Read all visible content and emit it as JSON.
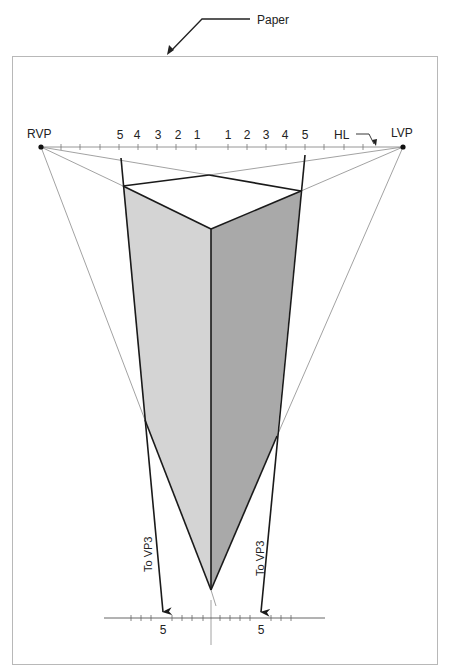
{
  "callout": {
    "label": "Paper"
  },
  "horizon": {
    "label": "HL",
    "left_vp_label": "RVP",
    "right_vp_label": "LVP",
    "left_scale": [
      "5",
      "4",
      "3",
      "2",
      "1"
    ],
    "right_scale": [
      "1",
      "2",
      "3",
      "4",
      "5"
    ]
  },
  "vp3": {
    "left_label": "To VP3",
    "right_label": "To VP3"
  },
  "ground_scale": {
    "left_mark": "5",
    "right_mark": "5"
  },
  "colors": {
    "line": "#1a1a1a",
    "construction": "#8a8a8a",
    "paper_border": "#b8b8b8",
    "left_face": "#d4d4d4",
    "right_face": "#a9a9a9",
    "top_face": "#ffffff"
  }
}
